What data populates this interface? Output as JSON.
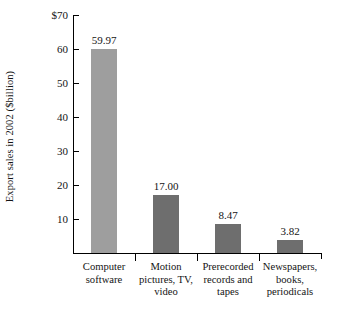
{
  "chart_data": {
    "type": "bar",
    "title": "",
    "subtitle": "",
    "xlabel": "",
    "ylabel": "Export sales in 2002 ($billion)",
    "categories": [
      "Computer software",
      "Motion pictures, TV, video",
      "Prerecorded records and tapes",
      "Newspapers, books, periodicals"
    ],
    "category_lines": [
      [
        "Computer",
        "software"
      ],
      [
        "Motion",
        "pictures, TV,",
        "video"
      ],
      [
        "Prerecorded",
        "records and",
        "tapes"
      ],
      [
        "Newspapers,",
        "books,",
        "periodicals"
      ]
    ],
    "values": [
      59.97,
      17.0,
      8.47,
      3.82
    ],
    "value_labels": [
      "59.97",
      "17.00",
      "8.47",
      "3.82"
    ],
    "ylim": [
      0,
      70
    ],
    "yticks": [
      10,
      20,
      30,
      40,
      50,
      60,
      70
    ],
    "ytick_labels": [
      "10",
      "20",
      "30",
      "40",
      "50",
      "60",
      "$70"
    ],
    "grid": false,
    "legend": false,
    "bar_colors": [
      "#9e9e9e",
      "#6e6e6e",
      "#6e6e6e",
      "#6e6e6e"
    ]
  },
  "style": {
    "axis_color": "#000000",
    "text_color": "#141414",
    "background": "#ffffff"
  }
}
